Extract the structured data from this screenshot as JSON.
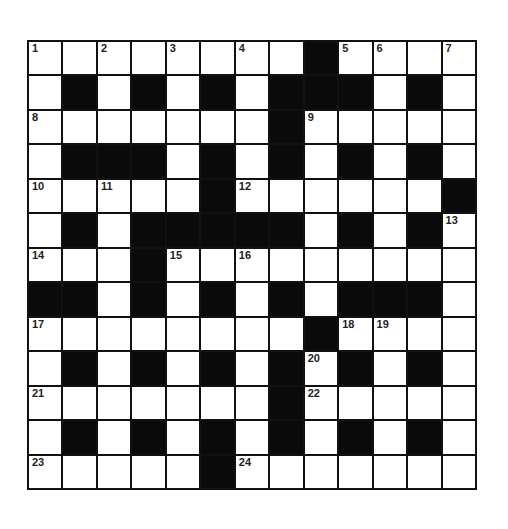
{
  "puzzle": {
    "type": "crossword",
    "size": 13,
    "colors": {
      "block": "#0a0a0a",
      "cell": "#ffffff",
      "line": "#111111"
    },
    "rows": [
      "........#....",
      ".#.#.#.###.#.",
      ".......#.....",
      ".###.#.#.#.#.",
      ".....#......#",
      ".#.#####.#.#.",
      "...#.........",
      "##.#.#.#.###.",
      "........#....",
      ".#.#.#.#.#.#.",
      ".......#.....",
      ".#.#.#.#.#.#.",
      ".....#......."
    ],
    "numbers": [
      {
        "n": "1",
        "r": 0,
        "c": 0
      },
      {
        "n": "2",
        "r": 0,
        "c": 2
      },
      {
        "n": "3",
        "r": 0,
        "c": 4
      },
      {
        "n": "4",
        "r": 0,
        "c": 6
      },
      {
        "n": "5",
        "r": 0,
        "c": 9
      },
      {
        "n": "6",
        "r": 0,
        "c": 10
      },
      {
        "n": "7",
        "r": 0,
        "c": 12
      },
      {
        "n": "8",
        "r": 2,
        "c": 0
      },
      {
        "n": "9",
        "r": 2,
        "c": 8
      },
      {
        "n": "10",
        "r": 4,
        "c": 0
      },
      {
        "n": "11",
        "r": 4,
        "c": 2
      },
      {
        "n": "12",
        "r": 4,
        "c": 6
      },
      {
        "n": "13",
        "r": 5,
        "c": 12
      },
      {
        "n": "14",
        "r": 6,
        "c": 0
      },
      {
        "n": "15",
        "r": 6,
        "c": 4
      },
      {
        "n": "16",
        "r": 6,
        "c": 6
      },
      {
        "n": "17",
        "r": 8,
        "c": 0
      },
      {
        "n": "18",
        "r": 8,
        "c": 9
      },
      {
        "n": "19",
        "r": 8,
        "c": 10
      },
      {
        "n": "20",
        "r": 9,
        "c": 8
      },
      {
        "n": "21",
        "r": 10,
        "c": 0
      },
      {
        "n": "22",
        "r": 10,
        "c": 8
      },
      {
        "n": "23",
        "r": 12,
        "c": 0
      },
      {
        "n": "24",
        "r": 12,
        "c": 6
      }
    ]
  }
}
